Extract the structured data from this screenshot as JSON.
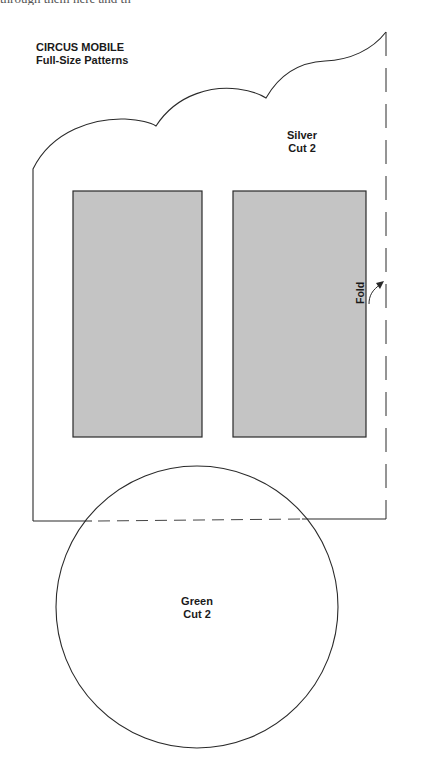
{
  "header": {
    "cut_off_text": "through them here and th"
  },
  "title": {
    "line1": "CIRCUS MOBILE",
    "line2": "Full-Size Patterns"
  },
  "pieces": {
    "silver": {
      "line1": "Silver",
      "line2": "Cut 2"
    },
    "green": {
      "line1": "Green",
      "line2": "Cut 2"
    }
  },
  "annotations": {
    "fold_label": "Fold"
  },
  "colors": {
    "line": "#2a2a2a",
    "window_fill": "#c4c4c4",
    "background": "#ffffff"
  }
}
